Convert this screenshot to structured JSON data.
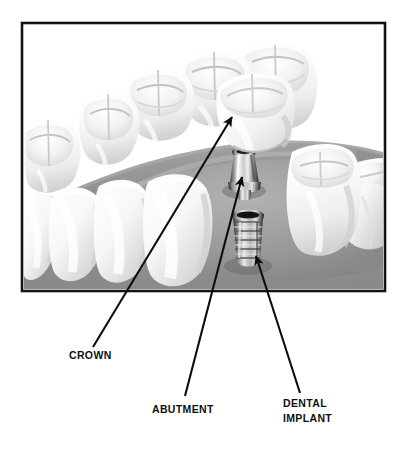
{
  "figure": {
    "title_visible": false,
    "type": "dental-implant-anatomy-diagram",
    "background_color": "#ffffff",
    "frame": {
      "border_color": "#121212",
      "x": 22,
      "y": 23,
      "width": 363,
      "height": 268,
      "fill_color": "#ffffff"
    },
    "gum": {
      "color": "#8f8f8f",
      "highlight_color": "#a8a8a8",
      "shadow_color": "#6f6f6f",
      "name": "gum-tissue-arch"
    },
    "teeth": {
      "enamel_color": "#fbfbfb",
      "enamel_shadow": "#cfcfcf",
      "enamel_mid": "#e9e9e9",
      "count_visible": 10
    },
    "components": {
      "crown": {
        "name": "dental-crown",
        "color": "#fcfcfc",
        "shade_color": "#d6d6d6"
      },
      "abutment": {
        "name": "abutment-post",
        "metal_light": "#f2f2f2",
        "metal_mid": "#9d9d9d",
        "metal_dark": "#2a2a2a"
      },
      "implant": {
        "name": "threaded-implant-screw",
        "metal_light": "#efefef",
        "metal_mid": "#a2a2a2",
        "metal_dark": "#1b1b1b",
        "bore_color": "#141414",
        "thread_count": 9
      }
    }
  },
  "annotations": {
    "line_color": "#0d0d0d",
    "line_width": 2.1,
    "items": [
      {
        "id": "crown",
        "label": "CROWN",
        "label_x": 69,
        "label_y": 357,
        "leader_from_x": 93,
        "leader_from_y": 347,
        "leader_to_x": 232,
        "leader_to_y": 117,
        "arrow_angle_deg": -59,
        "lines": [
          "CROWN"
        ]
      },
      {
        "id": "abutment",
        "label": "ABUTMENT",
        "label_x": 152,
        "label_y": 412,
        "leader_from_x": 185,
        "leader_from_y": 396,
        "leader_to_x": 242,
        "leader_to_y": 177,
        "arrow_angle_deg": -75,
        "lines": [
          "ABUTMENT"
        ]
      },
      {
        "id": "dental-implant",
        "label": "DENTAL IMPLANT",
        "label_x": 283,
        "label_y": 406,
        "leader_from_x": 300,
        "leader_from_y": 393,
        "leader_to_x": 256,
        "leader_to_y": 256,
        "arrow_angle_deg": 72,
        "lines": [
          "DENTAL",
          "IMPLANT"
        ]
      }
    ]
  }
}
